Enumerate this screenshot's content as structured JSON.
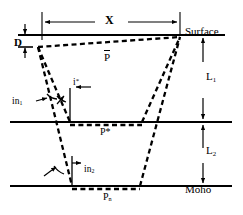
{
  "diagram": {
    "type": "seismic-ray-path-cross-section",
    "line_color": "#000000",
    "background": "#ffffff",
    "interfaces": [
      {
        "name": "surface",
        "label": "Surface",
        "y": 35,
        "style": "solid"
      },
      {
        "name": "conrad",
        "label": "P*",
        "y": 122,
        "style": "solid"
      },
      {
        "name": "moho",
        "label": "Moho",
        "y": 186,
        "style": "solid"
      }
    ],
    "labels": {
      "surface": "Surface",
      "moho": "Moho",
      "depth_d": "D",
      "distance_x": "X",
      "layer1_thickness": "L",
      "layer1_sub": "1",
      "layer2_thickness": "L",
      "layer2_sub": "2",
      "direct_phase": "P",
      "refracted_phase": "P*",
      "moho_phase": "P",
      "moho_phase_sub": "n",
      "incidence1": "in",
      "incidence1_sub": "1",
      "incidence2": "in",
      "incidence2_sub": "2",
      "critical_angle": "i",
      "critical_angle_sup": "*"
    },
    "geometry": {
      "source_x": 38,
      "source_y": 47,
      "receiver_x": 180,
      "receiver_y": 37,
      "x_dim_left": 42,
      "x_dim_right": 180,
      "pstar_left": 70,
      "pstar_right": 142,
      "pn_left": 72,
      "pn_right": 140
    },
    "annotations": {
      "ray_style": "dashed",
      "dimension_style": "double-headed-arrow",
      "angle_markers": [
        "in1",
        "i*",
        "in2"
      ]
    }
  }
}
